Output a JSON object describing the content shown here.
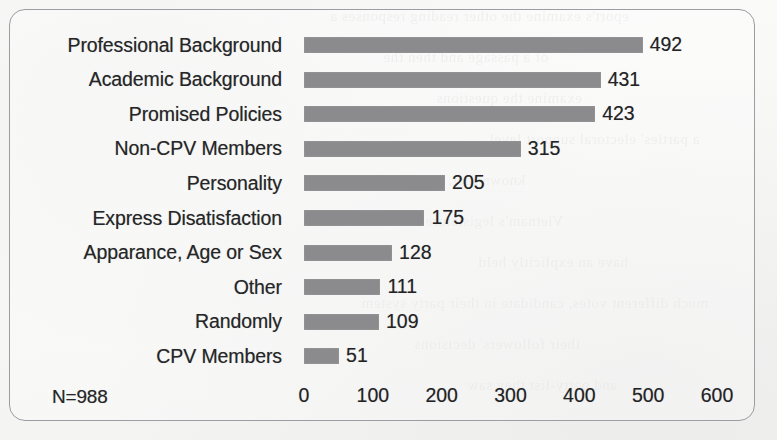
{
  "figure": {
    "sample_size_label": "N=988",
    "bar_color": "#8b8b8d",
    "frame_color": "#9c9ca2",
    "background_color": "#fbfbfa",
    "text_color": "#262628"
  },
  "chart_data": {
    "type": "bar",
    "orientation": "horizontal",
    "title": "",
    "subtitle": "",
    "xlabel": "",
    "ylabel": "",
    "categories": [
      "Professional Background",
      "Academic Background",
      "Promised Policies",
      "Non-CPV Members",
      "Personality",
      "Express Disatisfaction",
      "Apparance, Age or Sex",
      "Other",
      "Randomly",
      "CPV Members"
    ],
    "values": [
      492,
      431,
      423,
      315,
      205,
      175,
      128,
      111,
      109,
      51
    ],
    "value_labels": [
      "492",
      "431",
      "423",
      "315",
      "205",
      "175",
      "128",
      "111",
      "109",
      "51"
    ],
    "xlim": [
      0,
      600
    ],
    "xticks": [
      0,
      100,
      200,
      300,
      400,
      500,
      600
    ],
    "xtick_labels": [
      "0",
      "100",
      "200",
      "300",
      "400",
      "500",
      "600"
    ],
    "grid": false,
    "legend": false,
    "annotations": [
      "N=988"
    ]
  },
  "page_bleed": {
    "lines": [
      "eport's examine the other reading responses a",
      "of a passage and then the",
      "examine the questions",
      "a parties' electoral support level",
      "known fact, on side the",
      "Vietnam's legislature",
      "have an explicitly held",
      "much different votes, candidate in their party system",
      "their followers' decisions",
      "and party-list they saw"
    ]
  }
}
